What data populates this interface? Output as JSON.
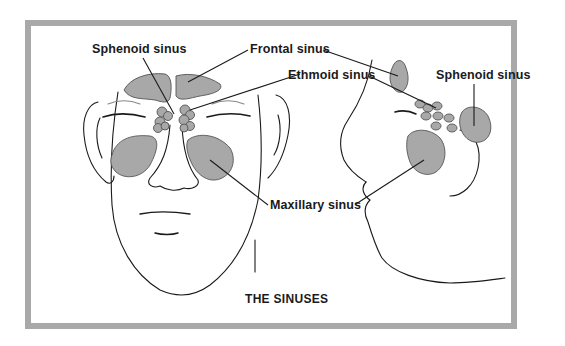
{
  "figure": {
    "title": "THE SINUSES",
    "labels": {
      "sphenoid_front": "Sphenoid sinus",
      "frontal": "Frontal sinus",
      "ethmoid": "Ethmoid sinus",
      "sphenoid_side": "Sphenoid sinus",
      "maxillary": "Maxillary sinus"
    },
    "colors": {
      "sinus_fill": "#a8a8a8",
      "frame_border": "#a9a9a9",
      "line": "#1a1a1a"
    }
  }
}
